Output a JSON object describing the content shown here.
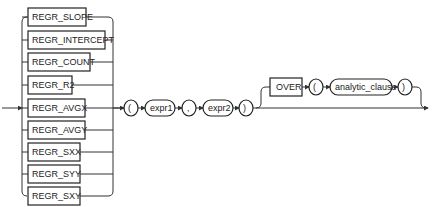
{
  "diagram": {
    "type": "railroad-syntax",
    "functions": [
      {
        "label": "REGR_SLOPE"
      },
      {
        "label": "REGR_INTERCEPT"
      },
      {
        "label": "REGR_COUNT"
      },
      {
        "label": "REGR_R2"
      },
      {
        "label": "REGR_AVGX"
      },
      {
        "label": "REGR_AVGY"
      },
      {
        "label": "REGR_SXX"
      },
      {
        "label": "REGR_SYY"
      },
      {
        "label": "REGR_SXY"
      }
    ],
    "sequence": {
      "open_paren": "(",
      "expr1": "expr1",
      "comma": ",",
      "expr2": "expr2",
      "close_paren": ")"
    },
    "optional_over": {
      "over": "OVER",
      "open_paren": "(",
      "analytic_clause": "analytic_clause",
      "close_paren": ")"
    }
  }
}
